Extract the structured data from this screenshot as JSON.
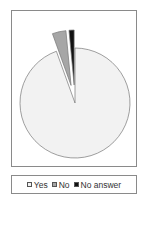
{
  "chart_data": {
    "type": "pie",
    "title": "",
    "categories": [
      "Yes",
      "No",
      "No answer"
    ],
    "values": [
      94.5,
      4.0,
      1.5
    ],
    "unit": "%",
    "exploded": [
      "No",
      "No answer"
    ],
    "colors": {
      "Yes": "#f2f2f2",
      "No": "#a6a6a6",
      "No answer": "#111111"
    },
    "legend_position": "bottom"
  },
  "legend": {
    "items": [
      {
        "label": "Yes",
        "color": "#f2f2f2"
      },
      {
        "label": "No",
        "color": "#a6a6a6"
      },
      {
        "label": "No answer",
        "color": "#111111"
      }
    ]
  }
}
